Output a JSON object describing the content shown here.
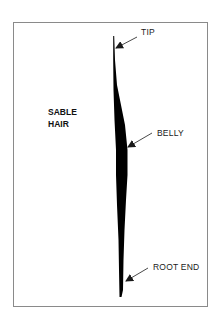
{
  "figure": {
    "title_lines": [
      "SABLE",
      "HAIR"
    ],
    "labels": {
      "tip": "TIP",
      "belly": "BELLY",
      "root": "ROOT END"
    },
    "colors": {
      "hair": "#000000",
      "frame": "#8a8a8a",
      "text": "#1a1a1a",
      "background": "#ffffff"
    }
  }
}
